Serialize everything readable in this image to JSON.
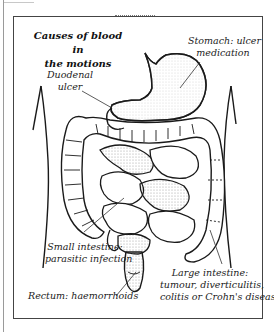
{
  "diagram": {
    "title_line1": "Causes of blood in",
    "title_line2": "the motions",
    "labels": {
      "stomach_line1": "Stomach: ulcer",
      "stomach_line2": "medication",
      "duodenal_line1": "Duodenal",
      "duodenal_line2": "ulcer",
      "small_intestine_line1": "Small intestine:",
      "small_intestine_line2": "parasitic infection",
      "rectum": "Rectum: haemorrhoids",
      "large_intestine_line1": "Large intestine:",
      "large_intestine_line2": "tumour, diverticulitis,",
      "large_intestine_line3": "colitis or Crohn's disease"
    },
    "colors": {
      "line": "#1a1a1a",
      "stipple": "#8a8a8a",
      "frame": "#444444"
    }
  }
}
